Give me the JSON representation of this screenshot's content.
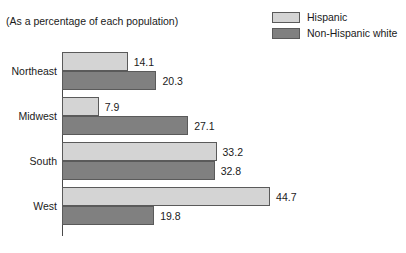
{
  "subtitle": "(As a percentage of each population)",
  "legend": {
    "position": "top-right",
    "entries": [
      {
        "label": "Hispanic",
        "color": "#d4d4d4"
      },
      {
        "label": "Non-Hispanic white",
        "color": "#808080"
      }
    ]
  },
  "colors": {
    "hispanic": "#d4d4d4",
    "non_hispanic_white": "#808080",
    "outline": "#5a5a5a",
    "axis": "#4a4a4a",
    "text": "#1a1a1a",
    "background": "#ffffff"
  },
  "chart_data": {
    "type": "bar",
    "orientation": "horizontal",
    "title": "",
    "subtitle": "(As a percentage of each population)",
    "xlabel": "",
    "ylabel": "",
    "categories": [
      "Northeast",
      "Midwest",
      "South",
      "West"
    ],
    "series": [
      {
        "name": "Hispanic",
        "color": "#d4d4d4",
        "values": [
          14.1,
          7.9,
          33.2,
          44.7
        ]
      },
      {
        "name": "Non-Hispanic white",
        "color": "#808080",
        "values": [
          20.3,
          27.1,
          32.8,
          19.8
        ]
      }
    ],
    "value_labels": [
      [
        "14.1",
        "20.3"
      ],
      [
        "7.9",
        "27.1"
      ],
      [
        "33.2",
        "32.8"
      ],
      [
        "44.7",
        "19.8"
      ]
    ],
    "xlim": [
      0,
      44.7
    ],
    "grid": false,
    "axis": "vertical-baseline-only",
    "legend_position": "top-right"
  }
}
